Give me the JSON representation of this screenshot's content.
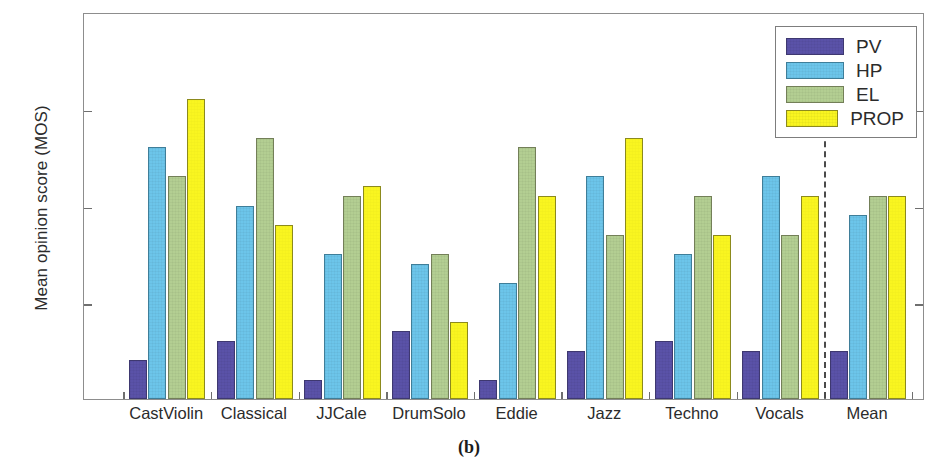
{
  "caption": "(b)",
  "axis": {
    "ylabel": "Mean opinion score (MOS)",
    "yticks": [
      "1",
      "2",
      "3",
      "4",
      "5"
    ],
    "ymin": 1,
    "ymax": 5
  },
  "legend": {
    "position": "top-right",
    "entries": [
      {
        "label": "PV",
        "color": "#5a52a8",
        "key": "pv"
      },
      {
        "label": "HP",
        "color": "#6cc5ea",
        "key": "hp"
      },
      {
        "label": "EL",
        "color": "#b3ce92",
        "key": "el"
      },
      {
        "label": "PROP",
        "color": "#f9f520",
        "key": "prop"
      }
    ]
  },
  "annotations": {
    "divider_after_category": "Vocals",
    "divider_style": "dashed"
  },
  "chart_data": {
    "type": "bar",
    "title": "",
    "xlabel": "",
    "ylabel": "Mean opinion score (MOS)",
    "ylim": [
      1,
      5
    ],
    "yticks": [
      1,
      2,
      3,
      4,
      5
    ],
    "grid": false,
    "categories": [
      "CastViolin",
      "Classical",
      "JJCale",
      "DrumSolo",
      "Eddie",
      "Jazz",
      "Techno",
      "Vocals",
      "Mean"
    ],
    "series": [
      {
        "name": "PV",
        "color": "#5a52a8",
        "values": [
          1.4,
          1.6,
          1.2,
          1.7,
          1.2,
          1.5,
          1.6,
          1.5,
          1.5
        ]
      },
      {
        "name": "HP",
        "color": "#6cc5ea",
        "values": [
          3.6,
          3.0,
          2.5,
          2.4,
          2.2,
          3.3,
          2.5,
          3.3,
          2.9
        ]
      },
      {
        "name": "EL",
        "color": "#b3ce92",
        "values": [
          3.3,
          3.7,
          3.1,
          2.5,
          3.6,
          2.7,
          3.1,
          2.7,
          3.1
        ]
      },
      {
        "name": "PROP",
        "color": "#f9f520",
        "values": [
          4.1,
          2.8,
          3.2,
          1.8,
          3.1,
          3.7,
          2.7,
          3.1,
          3.1
        ]
      }
    ]
  }
}
